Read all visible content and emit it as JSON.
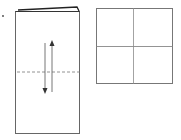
{
  "diagram": {
    "type": "paper-folding-instruction",
    "bullet": "•",
    "left_figure": {
      "label": "folded-paper",
      "shape": "tall rectangle with fold at top",
      "fold_line": "dashed horizontal",
      "arrows": [
        "down",
        "up"
      ]
    },
    "right_figure": {
      "label": "unfolded-square",
      "shape": "square divided into 4 quadrants"
    },
    "colors": {
      "stroke": "#555555",
      "dark_stroke": "#222222",
      "light_stroke": "#888888",
      "background": "#ffffff"
    }
  }
}
